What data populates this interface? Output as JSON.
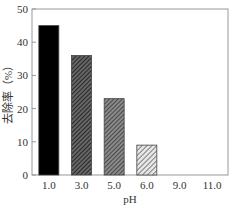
{
  "chart_data": {
    "type": "bar",
    "title": "",
    "xlabel": "pH",
    "ylabel": "去除率（%）",
    "categories": [
      "1.0",
      "3.0",
      "5.0",
      "6.0",
      "9.0",
      "11.0"
    ],
    "values": [
      45,
      36,
      23,
      9,
      0,
      0
    ],
    "ylim": [
      0,
      50
    ],
    "yticks": [
      0,
      10,
      20,
      30,
      40,
      50
    ],
    "grid": false,
    "legend": null,
    "bar_styles": [
      "solid-black",
      "dense-hatch-dark",
      "hatch-medium",
      "hatch-light",
      "none",
      "none"
    ]
  },
  "colors": {
    "axis": "#888888",
    "bar1": "#000000",
    "bar_hatch_dark": "#3a3a3a",
    "bar_hatch_mid": "#555555",
    "bar_hatch_light": "#777777"
  }
}
